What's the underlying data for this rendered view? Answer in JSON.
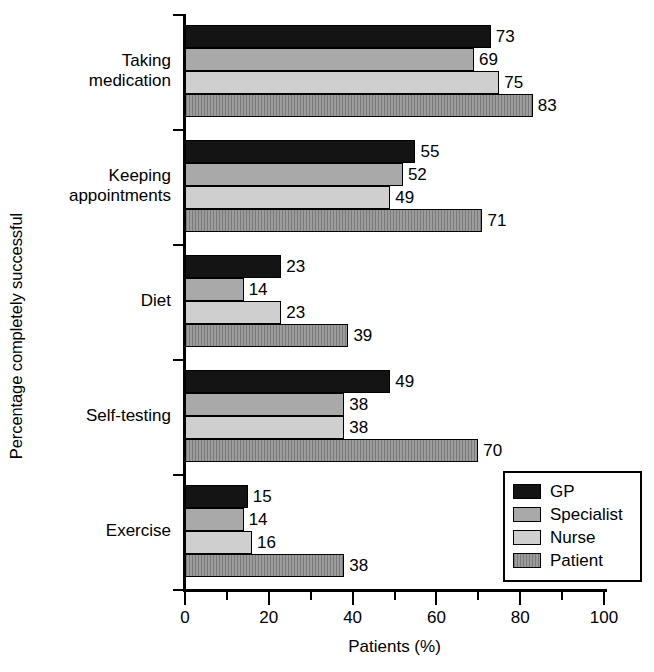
{
  "chart_data": {
    "type": "bar",
    "orientation": "horizontal",
    "title": "",
    "xlabel": "Patients (%)",
    "ylabel": "Percentage completely successful",
    "xlim": [
      0,
      100
    ],
    "xticks": [
      0,
      20,
      40,
      60,
      80,
      100
    ],
    "xtick_labels": [
      "0",
      "20",
      "40",
      "60",
      "80",
      "100"
    ],
    "minor_tick_step": 10,
    "grid": false,
    "legend_position": "bottom-right",
    "categories": [
      "Taking medication",
      "Keeping appointments",
      "Diet",
      "Self-testing",
      "Exercise"
    ],
    "category_label_lines": [
      [
        "Taking",
        "medication"
      ],
      [
        "Keeping",
        "appointments"
      ],
      [
        "Diet"
      ],
      [
        "Self-testing"
      ],
      [
        "Exercise"
      ]
    ],
    "series": [
      {
        "name": "GP",
        "color": "#141414",
        "values": [
          73,
          55,
          23,
          49,
          15
        ]
      },
      {
        "name": "Specialist",
        "color": "#a9a9a9",
        "values": [
          69,
          52,
          14,
          38,
          14
        ]
      },
      {
        "name": "Nurse",
        "color": "#cfcfcf",
        "values": [
          75,
          49,
          23,
          38,
          16
        ]
      },
      {
        "name": "Patient",
        "color": "#8c8c8c",
        "values": [
          83,
          71,
          39,
          70,
          38
        ]
      }
    ],
    "value_labels": [
      [
        "73",
        "69",
        "75",
        "83"
      ],
      [
        "55",
        "52",
        "49",
        "71"
      ],
      [
        "23",
        "14",
        "23",
        "39"
      ],
      [
        "49",
        "38",
        "38",
        "70"
      ],
      [
        "15",
        "14",
        "16",
        "38"
      ]
    ]
  },
  "legend": {
    "items": [
      {
        "label": "GP"
      },
      {
        "label": "Specialist"
      },
      {
        "label": "Nurse"
      },
      {
        "label": "Patient"
      }
    ]
  },
  "axes": {
    "x_title": "Patients (%)",
    "y_title": "Percentage completely successful",
    "x_tick_labels": [
      "0",
      "20",
      "40",
      "60",
      "80",
      "100"
    ]
  }
}
